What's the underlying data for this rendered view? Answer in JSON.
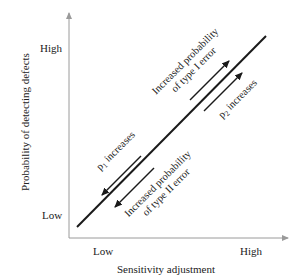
{
  "diagram": {
    "type": "conceptual-line-diagram",
    "y_axis": {
      "title": "Probability of detecting defects",
      "tick_high": "High",
      "tick_low": "Low"
    },
    "x_axis": {
      "title": "Sensitivity adjustment",
      "tick_low": "Low",
      "tick_high": "High"
    },
    "main_line": {
      "from": "low-low",
      "to": "high-high"
    },
    "annotations": {
      "upper_left": {
        "line1": "Increased probability",
        "line2": "of type I error",
        "arrow_direction": "up-right"
      },
      "upper_right": {
        "text_prefix": "p",
        "subscript": "2",
        "text_suffix": " increases",
        "arrow_direction": "up-right"
      },
      "lower_left": {
        "text_prefix": "p",
        "subscript": "1",
        "text_suffix": " increases",
        "arrow_direction": "down-left"
      },
      "lower_right": {
        "line1": "Increased probability",
        "line2": "of type II error",
        "arrow_direction": "down-left"
      }
    },
    "colors": {
      "axis": "#9a9a9a",
      "line": "#1a1a1a",
      "text": "#222222"
    }
  }
}
